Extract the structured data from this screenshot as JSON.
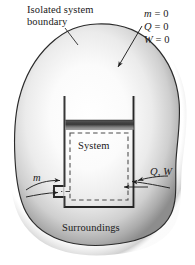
{
  "figure": {
    "labels": {
      "isolated_boundary": "Isolated system boundary",
      "mass_zero_var": "m",
      "mass_zero_val": " = 0",
      "heat_zero_var": "Q",
      "heat_zero_val": " = 0",
      "work_zero_var": "W",
      "work_zero_val": " = 0",
      "system": "System",
      "surroundings": "Surroundings",
      "mass_flow": "m",
      "heat_work": "Q, W"
    },
    "colors": {
      "outline": "#2b2b2b",
      "blob_light": "#ffffff",
      "blob_mid": "#d9d9d9",
      "blob_dark": "#8e8e8e",
      "piston_dark": "#3d3d3d",
      "piston_light": "#b9b9b9",
      "dashed_boundary": "#555555",
      "text": "#1a1a1a",
      "background": "#ffffff"
    },
    "geometry": {
      "width": 195,
      "height": 265,
      "cylinder_left": 63,
      "cylinder_right": 134,
      "cylinder_top": 96,
      "cylinder_bottom": 207,
      "piston_top": 120,
      "piston_height": 9
    }
  }
}
